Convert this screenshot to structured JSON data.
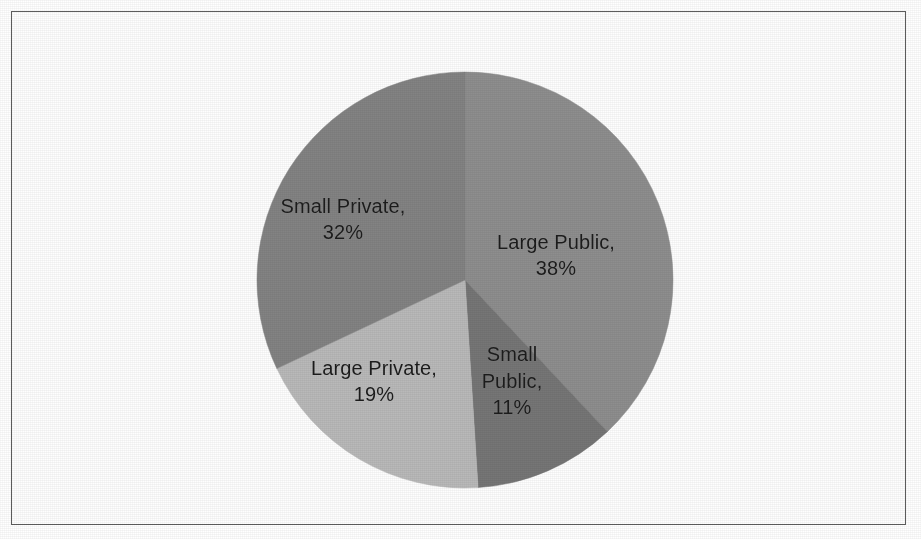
{
  "figure": {
    "background_color": "#ffffff",
    "border_color": "#5d5d5d",
    "label_text_color": "#1c1c1c"
  },
  "chart_data": {
    "type": "pie",
    "title": "",
    "subtitle": "",
    "xlabel": "",
    "ylabel": "",
    "grid": false,
    "legend": "none",
    "label_format": "{name}, {value}%",
    "start_angle_deg": 0,
    "direction": "clockwise",
    "center": {
      "x": 465,
      "y": 280
    },
    "radius": 208,
    "categories": [
      "Large Public",
      "Small Public",
      "Large Private",
      "Small Private"
    ],
    "values": [
      38,
      11,
      19,
      32
    ],
    "total": 100,
    "slices": [
      {
        "name": "Large Public",
        "value": 38,
        "value_label": "38%",
        "label": "Large Public,\n38%",
        "color": "#8e8e8e",
        "start_angle_deg": 0,
        "end_angle_deg": 136.8,
        "label_x": 556,
        "label_y": 255
      },
      {
        "name": "Small Public",
        "value": 11,
        "value_label": "11%",
        "label": "Small\nPublic,\n11%",
        "color": "#767676",
        "start_angle_deg": 136.8,
        "end_angle_deg": 176.4,
        "label_x": 512,
        "label_y": 381
      },
      {
        "name": "Large Private",
        "value": 19,
        "value_label": "19%",
        "label": "Large Private,\n19%",
        "color": "#b9b9b9",
        "start_angle_deg": 176.4,
        "end_angle_deg": 244.8,
        "label_x": 374,
        "label_y": 381
      },
      {
        "name": "Small Private",
        "value": 32,
        "value_label": "32%",
        "label": "Small Private,\n32%",
        "color": "#838383",
        "start_angle_deg": 244.8,
        "end_angle_deg": 360,
        "label_x": 343,
        "label_y": 219
      }
    ]
  }
}
